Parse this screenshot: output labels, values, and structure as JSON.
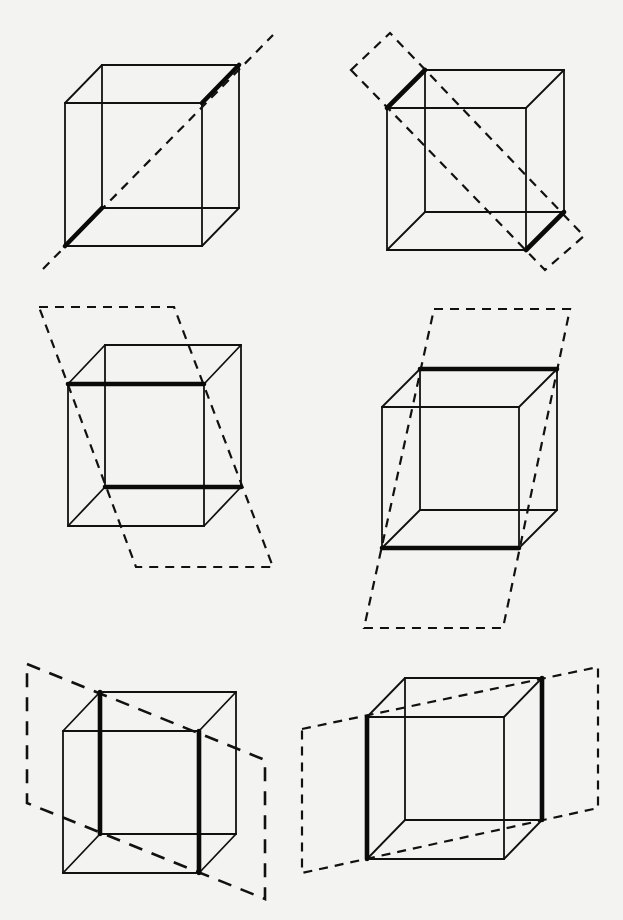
{
  "figure": {
    "colors": {
      "background": "#f3f3f1",
      "ink": "#111111"
    },
    "panels": [
      {
        "id": "cube-1",
        "position": "top-left",
        "cube": {
          "front": [
            65,
            103,
            137,
            143
          ],
          "depth_offset": [
            37,
            -38
          ]
        },
        "highlight_edges": [
          "front-bottom-left depth edge",
          "front-top-right depth edge"
        ],
        "construction": {
          "type": "line",
          "points": [
            [
              43,
              269
            ],
            [
              273,
              35
            ]
          ],
          "label": "space diagonal axis"
        }
      },
      {
        "id": "cube-2",
        "position": "top-right",
        "cube": {
          "front": [
            387,
            108,
            139,
            142
          ],
          "depth_offset": [
            38,
            -38
          ]
        },
        "highlight_edges": [
          "top-left depth edge",
          "bottom-right depth edge"
        ],
        "construction": {
          "type": "plane",
          "points": [
            [
              351,
              70
            ],
            [
              390,
              33
            ],
            [
              584,
              236
            ],
            [
              545,
              270
            ]
          ],
          "label": "diagonal rectangle plane"
        }
      },
      {
        "id": "cube-3",
        "position": "middle-left",
        "cube": {
          "front": [
            68,
            384,
            136,
            142
          ],
          "depth_offset": [
            37,
            -39
          ]
        },
        "highlight_edges": [
          "front top edge",
          "back bottom edge"
        ],
        "construction": {
          "type": "plane",
          "points": [
            [
              39,
              307
            ],
            [
              174,
              307
            ],
            [
              273,
              567
            ],
            [
              136,
              567
            ]
          ],
          "label": "slanted parallelogram plane"
        }
      },
      {
        "id": "cube-4",
        "position": "middle-right",
        "cube": {
          "front": [
            382,
            407,
            137,
            141
          ],
          "depth_offset": [
            38,
            -38
          ]
        },
        "highlight_edges": [
          "back top edge",
          "front bottom edge"
        ],
        "construction": {
          "type": "plane",
          "points": [
            [
              434,
              309
            ],
            [
              570,
              309
            ],
            [
              503,
              628
            ],
            [
              364,
              628
            ]
          ],
          "label": "slanted parallelogram plane"
        }
      },
      {
        "id": "cube-5",
        "position": "bottom-left",
        "cube": {
          "front": [
            63,
            731,
            136,
            142
          ],
          "depth_offset": [
            37,
            -39
          ]
        },
        "highlight_edges": [
          "back left vertical edge",
          "front right vertical edge"
        ],
        "construction": {
          "type": "plane",
          "points": [
            [
              27,
              664
            ],
            [
              265,
              760
            ],
            [
              265,
              899
            ],
            [
              27,
              803
            ]
          ],
          "label": "vertical diagonal plane"
        }
      },
      {
        "id": "cube-6",
        "position": "bottom-right",
        "cube": {
          "front": [
            367,
            717,
            137,
            142
          ],
          "depth_offset": [
            38,
            -39
          ]
        },
        "highlight_edges": [
          "front left vertical edge",
          "back right vertical edge"
        ],
        "construction": {
          "type": "plane",
          "points": [
            [
              302,
              729
            ],
            [
              598,
              667
            ],
            [
              598,
              808
            ],
            [
              302,
              873
            ]
          ],
          "label": "vertical diagonal plane"
        }
      }
    ]
  }
}
